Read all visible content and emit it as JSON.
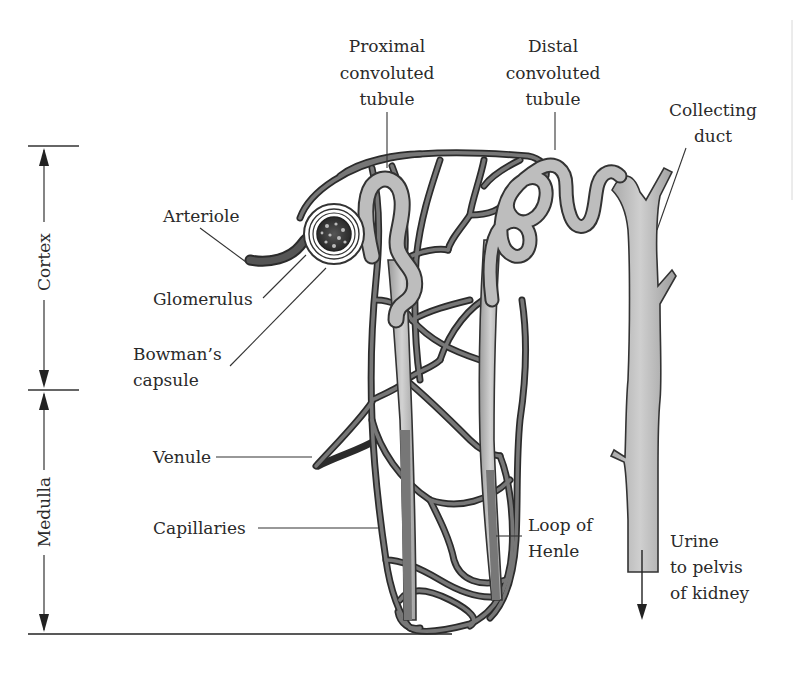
{
  "figure": {
    "zones": {
      "cortex": "Cortex",
      "medulla": "Medulla"
    },
    "labels": {
      "proximal": [
        "Proximal",
        "convoluted",
        "tubule"
      ],
      "distal": [
        "Distal",
        "convoluted",
        "tubule"
      ],
      "collecting": [
        "Collecting",
        "duct"
      ],
      "arteriole": "Arteriole",
      "glomerulus": "Glomerulus",
      "bowmans": [
        "Bowman’s",
        "capsule"
      ],
      "venule": "Venule",
      "capillaries": "Capillaries",
      "loop": [
        "Loop of",
        "Henle"
      ],
      "urine": [
        "Urine",
        "to pelvis",
        "of kidney"
      ]
    },
    "colors": {
      "vessel_dark": "#2b2b2b",
      "vessel_mid": "#6e6e6e",
      "tubule_fill": "#bdbdbd",
      "outline": "#333333",
      "text": "#2a2a2a",
      "background": "#ffffff"
    }
  }
}
